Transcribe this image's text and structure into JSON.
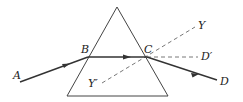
{
  "diagram": {
    "type": "prism-refraction",
    "labels": {
      "A": "A",
      "B": "B",
      "C": "C",
      "D": "D",
      "D_prime": "D′",
      "Y": "Y",
      "Y_prime": "Y′"
    },
    "colors": {
      "line": "#333333",
      "prism": "#444444",
      "dashed": "#555555"
    }
  }
}
